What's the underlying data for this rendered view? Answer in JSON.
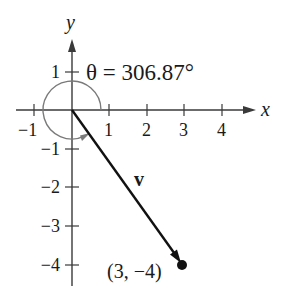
{
  "diagram": {
    "type": "vector-angle-diagram",
    "axes": {
      "x_label": "x",
      "y_label": "y",
      "x_ticks": [
        "−1",
        "1",
        "2",
        "3",
        "4"
      ],
      "y_ticks": [
        "1",
        "−1",
        "−2",
        "−3",
        "−4"
      ]
    },
    "angle": {
      "symbol": "θ",
      "label": "θ = 306.87°",
      "value_degrees": 306.87
    },
    "vector": {
      "name": "v",
      "from": [
        0,
        0
      ],
      "to": [
        3,
        -4
      ]
    },
    "point": {
      "label": "(3, −4)",
      "x": 3,
      "y": -4
    },
    "colors": {
      "axis": "#3a3a3a",
      "vector": "#111111",
      "arc": "#7a7a7a",
      "text": "#1a1a1a"
    }
  }
}
